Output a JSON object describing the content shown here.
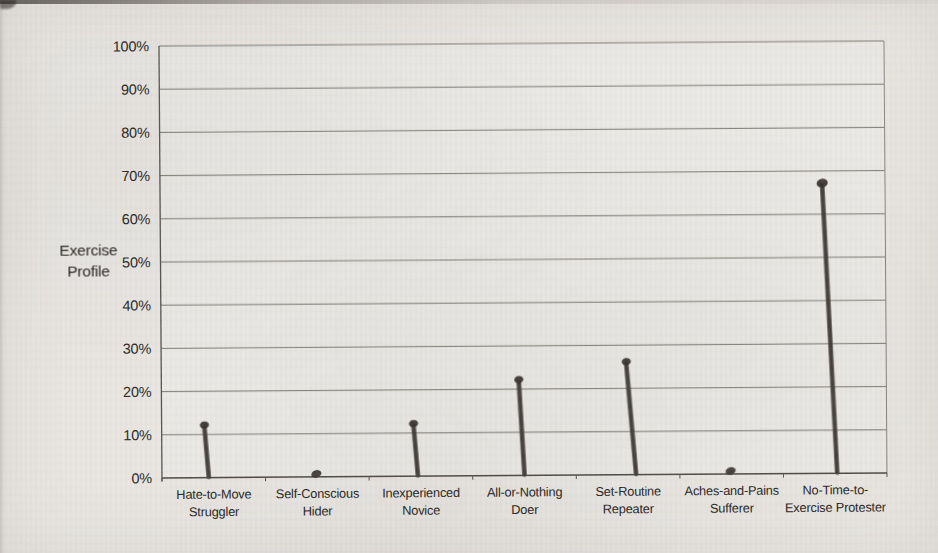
{
  "ylabel": {
    "line1": "Exercise",
    "line2": "Profile"
  },
  "chart_data": {
    "type": "bar",
    "title": "",
    "xlabel": "",
    "ylabel": "Exercise Profile",
    "ylim": [
      0,
      100
    ],
    "ytick_step": 10,
    "yticks": [
      "0%",
      "10%",
      "20%",
      "30%",
      "40%",
      "50%",
      "60%",
      "70%",
      "80%",
      "90%",
      "100%"
    ],
    "grid": "horizontal",
    "legend": "none",
    "categories": [
      "Hate-to-Move Struggler",
      "Self-Conscious Hider",
      "Inexperienced Novice",
      "All-or-Nothing Doer",
      "Set-Routine Repeater",
      "Aches-and-Pains Sufferer",
      "No-Time-to-Exercise Protester"
    ],
    "category_label_lines": [
      [
        "Hate-to-Move",
        "Struggler"
      ],
      [
        "Self-Conscious",
        "Hider"
      ],
      [
        "Inexperienced",
        "Novice"
      ],
      [
        "All-or-Nothing",
        "Doer"
      ],
      [
        "Set-Routine",
        "Repeater"
      ],
      [
        "Aches-and-Pains",
        "Sufferer"
      ],
      [
        "No-Time-to-",
        "Exercise Protester"
      ]
    ],
    "values": [
      13,
      1,
      13,
      23,
      27,
      1,
      68
    ],
    "bar_style": "thin hand-drawn stroke with blob cap (scanned print)",
    "bar_color": "#4b4742",
    "bar_cap_color": "#36322d",
    "gridline_color": "#7e7b76",
    "axis_color": "#4e4b46",
    "text_color": "#2b2927",
    "paper_color": "#e9e6e2"
  }
}
